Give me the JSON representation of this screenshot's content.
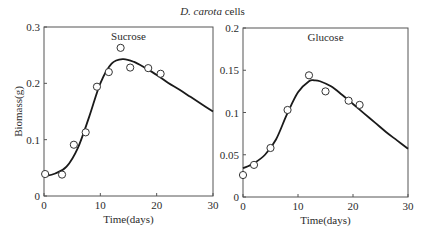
{
  "figure": {
    "title_italic": "D. carota",
    "title_rest": " cells"
  },
  "chart_data": [
    {
      "type": "line",
      "title": "Sucrose",
      "xlabel": "Time(days)",
      "ylabel": "Biomass(g)",
      "xlim": [
        0,
        30
      ],
      "ylim": [
        0,
        0.3
      ],
      "xticks": [
        0,
        10,
        20,
        30
      ],
      "yticks": [
        0,
        0.1,
        0.2,
        0.3
      ],
      "ytick_labels": [
        "0",
        "0.1",
        "0.2",
        "0.3"
      ],
      "grid": false,
      "series": [
        {
          "name": "Observed",
          "kind": "scatter",
          "marker": "open-circle",
          "x": [
            0.2,
            3.2,
            5.3,
            7.4,
            9.4,
            11.5,
            13.6,
            15.3,
            18.5,
            20.7
          ],
          "y": [
            0.039,
            0.038,
            0.091,
            0.113,
            0.194,
            0.22,
            0.263,
            0.228,
            0.227,
            0.217
          ]
        },
        {
          "name": "Model",
          "kind": "line",
          "x": [
            0,
            2,
            4,
            6,
            8,
            10,
            12,
            14,
            16,
            18,
            20,
            22,
            24,
            26,
            28,
            30
          ],
          "y": [
            0.035,
            0.04,
            0.052,
            0.085,
            0.14,
            0.2,
            0.235,
            0.243,
            0.238,
            0.227,
            0.215,
            0.201,
            0.189,
            0.176,
            0.163,
            0.15
          ]
        }
      ]
    },
    {
      "type": "line",
      "title": "Glucose",
      "xlabel": "Time(days)",
      "ylabel": "",
      "xlim": [
        0,
        30
      ],
      "ylim": [
        0,
        0.2
      ],
      "xticks": [
        0,
        10,
        20,
        30
      ],
      "yticks": [
        0,
        0.05,
        0.1,
        0.15,
        0.2
      ],
      "ytick_labels": [
        "0",
        "0.05",
        "0.1",
        "0.15",
        "0.2"
      ],
      "grid": false,
      "series": [
        {
          "name": "Observed",
          "kind": "scatter",
          "marker": "open-circle",
          "x": [
            0,
            2.0,
            5.0,
            8.1,
            12.0,
            15.0,
            19.2,
            21.2
          ],
          "y": [
            0.026,
            0.038,
            0.058,
            0.103,
            0.144,
            0.125,
            0.114,
            0.109
          ]
        },
        {
          "name": "Model",
          "kind": "line",
          "x": [
            0,
            2,
            4,
            6,
            8,
            10,
            12,
            13,
            14,
            16,
            18,
            20,
            22,
            24,
            26,
            28,
            30
          ],
          "y": [
            0.034,
            0.04,
            0.05,
            0.068,
            0.098,
            0.124,
            0.137,
            0.138,
            0.137,
            0.131,
            0.121,
            0.11,
            0.099,
            0.088,
            0.077,
            0.067,
            0.057
          ]
        }
      ]
    }
  ],
  "layout": {
    "panels": [
      {
        "left": 44,
        "right": 213,
        "top": 27,
        "bottom": 196
      },
      {
        "left": 243,
        "right": 408,
        "top": 28,
        "bottom": 197
      }
    ]
  }
}
